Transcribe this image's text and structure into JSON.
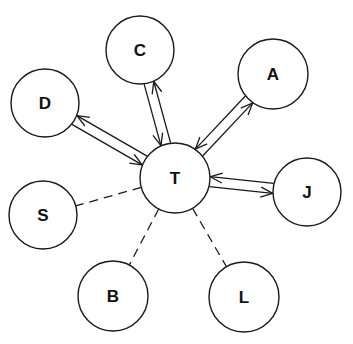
{
  "diagram": {
    "type": "star-network",
    "center": "T",
    "nodes": [
      {
        "id": "T",
        "label": "T",
        "x": 175,
        "y": 178,
        "r": 35
      },
      {
        "id": "C",
        "label": "C",
        "x": 140,
        "y": 50,
        "r": 34
      },
      {
        "id": "A",
        "label": "A",
        "x": 273,
        "y": 74,
        "r": 35
      },
      {
        "id": "D",
        "label": "D",
        "x": 45,
        "y": 103,
        "r": 34
      },
      {
        "id": "J",
        "label": "J",
        "x": 307,
        "y": 192,
        "r": 34
      },
      {
        "id": "S",
        "label": "S",
        "x": 43,
        "y": 215,
        "r": 34
      },
      {
        "id": "B",
        "label": "B",
        "x": 113,
        "y": 296,
        "r": 35
      },
      {
        "id": "L",
        "label": "L",
        "x": 244,
        "y": 297,
        "r": 35
      }
    ],
    "edges": [
      {
        "from": "T",
        "to": "C",
        "style": "bidirectional-arrows"
      },
      {
        "from": "T",
        "to": "A",
        "style": "bidirectional-arrows"
      },
      {
        "from": "T",
        "to": "D",
        "style": "bidirectional-arrows"
      },
      {
        "from": "T",
        "to": "J",
        "style": "bidirectional-arrows"
      },
      {
        "from": "T",
        "to": "S",
        "style": "dashed"
      },
      {
        "from": "T",
        "to": "B",
        "style": "dashed"
      },
      {
        "from": "T",
        "to": "L",
        "style": "dashed"
      }
    ]
  }
}
